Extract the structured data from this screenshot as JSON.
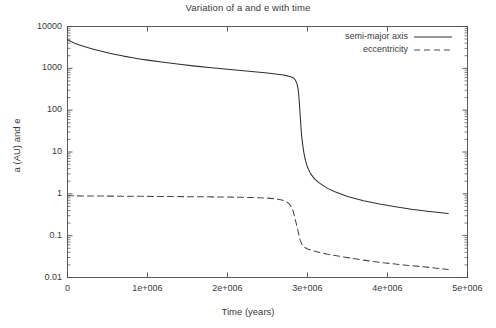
{
  "chart_data": {
    "type": "line",
    "title": "Variation of a and e with time",
    "xlabel": "Time (years)",
    "ylabel": "a (AU) and e",
    "xlim": [
      0,
      5000000
    ],
    "ylim": [
      0.01,
      10000
    ],
    "yscale": "log",
    "xscale": "linear",
    "grid": false,
    "legend_position": "top-right",
    "xticks": [
      {
        "value": 0,
        "label": "0"
      },
      {
        "value": 1000000,
        "label": "1e+006"
      },
      {
        "value": 2000000,
        "label": "2e+006"
      },
      {
        "value": 3000000,
        "label": "3e+006"
      },
      {
        "value": 4000000,
        "label": "4e+006"
      },
      {
        "value": 5000000,
        "label": "5e+006"
      }
    ],
    "yticks": [
      {
        "value": 10000,
        "label": "10000"
      },
      {
        "value": 1000,
        "label": "1000"
      },
      {
        "value": 100,
        "label": "100"
      },
      {
        "value": 10,
        "label": "10"
      },
      {
        "value": 1,
        "label": "1"
      },
      {
        "value": 0.1,
        "label": "0.1"
      },
      {
        "value": 0.01,
        "label": "0.01"
      }
    ],
    "series": [
      {
        "name": "semi-major axis",
        "style": "solid",
        "color": "#303030",
        "points": [
          [
            0,
            4800
          ],
          [
            50000,
            4300
          ],
          [
            100000,
            3900
          ],
          [
            150000,
            3600
          ],
          [
            200000,
            3350
          ],
          [
            300000,
            2950
          ],
          [
            400000,
            2620
          ],
          [
            500000,
            2370
          ],
          [
            600000,
            2150
          ],
          [
            700000,
            1960
          ],
          [
            800000,
            1810
          ],
          [
            900000,
            1680
          ],
          [
            1000000,
            1570
          ],
          [
            1200000,
            1390
          ],
          [
            1400000,
            1250
          ],
          [
            1600000,
            1130
          ],
          [
            1800000,
            1035
          ],
          [
            2000000,
            955
          ],
          [
            2200000,
            880
          ],
          [
            2400000,
            810
          ],
          [
            2500000,
            775
          ],
          [
            2600000,
            735
          ],
          [
            2700000,
            690
          ],
          [
            2750000,
            660
          ],
          [
            2800000,
            620
          ],
          [
            2830000,
            580
          ],
          [
            2850000,
            520
          ],
          [
            2870000,
            420
          ],
          [
            2885000,
            300
          ],
          [
            2895000,
            180
          ],
          [
            2905000,
            95
          ],
          [
            2915000,
            48
          ],
          [
            2925000,
            26
          ],
          [
            2940000,
            15
          ],
          [
            2955000,
            9.5
          ],
          [
            2975000,
            6.2
          ],
          [
            3000000,
            4.3
          ],
          [
            3040000,
            3.0
          ],
          [
            3090000,
            2.25
          ],
          [
            3150000,
            1.8
          ],
          [
            3250000,
            1.35
          ],
          [
            3350000,
            1.1
          ],
          [
            3500000,
            0.86
          ],
          [
            3700000,
            0.68
          ],
          [
            3900000,
            0.57
          ],
          [
            4100000,
            0.49
          ],
          [
            4300000,
            0.43
          ],
          [
            4500000,
            0.385
          ],
          [
            4700000,
            0.35
          ],
          [
            4760000,
            0.34
          ]
        ]
      },
      {
        "name": "eccentricity",
        "style": "dashed",
        "color": "#484848",
        "points": [
          [
            0,
            0.9
          ],
          [
            100000,
            0.895
          ],
          [
            300000,
            0.888
          ],
          [
            600000,
            0.88
          ],
          [
            900000,
            0.872
          ],
          [
            1200000,
            0.864
          ],
          [
            1500000,
            0.856
          ],
          [
            1800000,
            0.846
          ],
          [
            2000000,
            0.838
          ],
          [
            2200000,
            0.826
          ],
          [
            2400000,
            0.808
          ],
          [
            2500000,
            0.79
          ],
          [
            2600000,
            0.76
          ],
          [
            2680000,
            0.715
          ],
          [
            2730000,
            0.66
          ],
          [
            2770000,
            0.58
          ],
          [
            2800000,
            0.48
          ],
          [
            2820000,
            0.39
          ],
          [
            2835000,
            0.305
          ],
          [
            2845000,
            0.248
          ],
          [
            2855000,
            0.21
          ],
          [
            2865000,
            0.175
          ],
          [
            2880000,
            0.132
          ],
          [
            2895000,
            0.098
          ],
          [
            2910000,
            0.076
          ],
          [
            2930000,
            0.062
          ],
          [
            2960000,
            0.053
          ],
          [
            3000000,
            0.048
          ],
          [
            3100000,
            0.042
          ],
          [
            3250000,
            0.036
          ],
          [
            3450000,
            0.031
          ],
          [
            3700000,
            0.026
          ],
          [
            3950000,
            0.0225
          ],
          [
            4200000,
            0.02
          ],
          [
            4450000,
            0.018
          ],
          [
            4700000,
            0.016
          ],
          [
            4760000,
            0.0155
          ]
        ]
      }
    ]
  },
  "legend": {
    "items": [
      {
        "label": "semi-major axis"
      },
      {
        "label": "eccentricity"
      }
    ]
  }
}
